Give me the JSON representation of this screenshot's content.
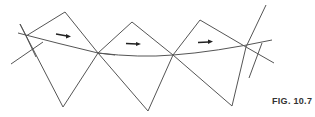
{
  "figure": {
    "caption": "FIG. 10.7",
    "line_color": "#555555",
    "arrow_color": "#222222",
    "arrows": [
      {
        "x1": 56,
        "y1": 34,
        "x2": 70,
        "y2": 36,
        "direction": "right"
      },
      {
        "x1": 126,
        "y1": 43,
        "x2": 140,
        "y2": 44,
        "direction": "right"
      },
      {
        "x1": 198,
        "y1": 42,
        "x2": 212,
        "y2": 41,
        "direction": "right"
      }
    ]
  }
}
